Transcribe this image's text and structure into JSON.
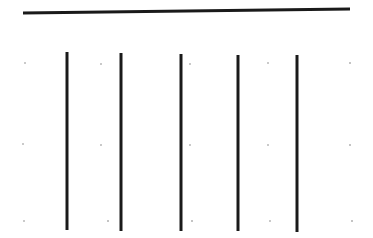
{
  "figure": {
    "width": 373,
    "height": 238,
    "background_color": "#ffffff",
    "ink_color": "#1a1a1a",
    "speck_color": "#b9b9b9"
  },
  "chart_data": {
    "type": "line",
    "xlabel": "",
    "ylabel": "",
    "xlim": [
      0,
      373
    ],
    "ylim": [
      238,
      0
    ],
    "grid": false,
    "legend": "none",
    "series": [
      {
        "name": "horizontal-rule",
        "orientation": "horizontal",
        "color": "#1a1a1a",
        "thickness": 3,
        "x": [
          23,
          350
        ],
        "y": [
          13,
          9
        ]
      },
      {
        "name": "vertical-rule-1",
        "orientation": "vertical",
        "color": "#1a1a1a",
        "thickness": 3,
        "x": [
          67,
          67
        ],
        "y": [
          52,
          230
        ]
      },
      {
        "name": "vertical-rule-2",
        "orientation": "vertical",
        "color": "#1a1a1a",
        "thickness": 3,
        "x": [
          121,
          121
        ],
        "y": [
          53,
          231
        ]
      },
      {
        "name": "vertical-rule-3",
        "orientation": "vertical",
        "color": "#1a1a1a",
        "thickness": 3,
        "x": [
          181,
          181
        ],
        "y": [
          54,
          231
        ]
      },
      {
        "name": "vertical-rule-4",
        "orientation": "vertical",
        "color": "#1a1a1a",
        "thickness": 3,
        "x": [
          238,
          238
        ],
        "y": [
          55,
          231
        ]
      },
      {
        "name": "vertical-rule-5",
        "orientation": "vertical",
        "color": "#1a1a1a",
        "thickness": 3,
        "x": [
          297,
          297
        ],
        "y": [
          55,
          232
        ]
      }
    ],
    "annotations": [
      {
        "name": "speck",
        "x": 25,
        "y": 63,
        "size": 2.0
      },
      {
        "name": "speck",
        "x": 101,
        "y": 64,
        "size": 1.8
      },
      {
        "name": "speck",
        "x": 190,
        "y": 64,
        "size": 1.8
      },
      {
        "name": "speck",
        "x": 268,
        "y": 63,
        "size": 2.0
      },
      {
        "name": "speck",
        "x": 350,
        "y": 63,
        "size": 1.6
      },
      {
        "name": "speck",
        "x": 23,
        "y": 144,
        "size": 2.2
      },
      {
        "name": "speck",
        "x": 101,
        "y": 145,
        "size": 1.8
      },
      {
        "name": "speck",
        "x": 190,
        "y": 145,
        "size": 1.8
      },
      {
        "name": "speck",
        "x": 268,
        "y": 145,
        "size": 2.0
      },
      {
        "name": "speck",
        "x": 350,
        "y": 145,
        "size": 1.6
      },
      {
        "name": "speck",
        "x": 24,
        "y": 221,
        "size": 2.0
      },
      {
        "name": "speck",
        "x": 108,
        "y": 221,
        "size": 1.6
      },
      {
        "name": "speck",
        "x": 192,
        "y": 221,
        "size": 1.6
      },
      {
        "name": "speck",
        "x": 270,
        "y": 221,
        "size": 1.8
      },
      {
        "name": "speck",
        "x": 352,
        "y": 221,
        "size": 1.6
      }
    ]
  }
}
